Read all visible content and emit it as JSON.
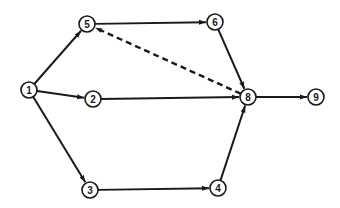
{
  "diagram": {
    "type": "activity-network",
    "nodes": [
      {
        "id": "1",
        "label": "1",
        "x": 29,
        "y": 90
      },
      {
        "id": "2",
        "label": "2",
        "x": 93,
        "y": 99
      },
      {
        "id": "3",
        "label": "3",
        "x": 90,
        "y": 190
      },
      {
        "id": "4",
        "label": "4",
        "x": 218,
        "y": 188
      },
      {
        "id": "5",
        "label": "5",
        "x": 87,
        "y": 24
      },
      {
        "id": "6",
        "label": "6",
        "x": 215,
        "y": 22
      },
      {
        "id": "8",
        "label": "8",
        "x": 248,
        "y": 97
      },
      {
        "id": "9",
        "label": "9",
        "x": 316,
        "y": 97
      }
    ],
    "edges": [
      {
        "from": "1",
        "to": "5",
        "style": "solid"
      },
      {
        "from": "1",
        "to": "2",
        "style": "solid"
      },
      {
        "from": "1",
        "to": "3",
        "style": "solid"
      },
      {
        "from": "5",
        "to": "6",
        "style": "solid"
      },
      {
        "from": "6",
        "to": "8",
        "style": "solid"
      },
      {
        "from": "2",
        "to": "8",
        "style": "solid"
      },
      {
        "from": "3",
        "to": "4",
        "style": "solid"
      },
      {
        "from": "4",
        "to": "8",
        "style": "solid"
      },
      {
        "from": "8",
        "to": "5",
        "style": "dashed"
      },
      {
        "from": "8",
        "to": "9",
        "style": "solid"
      }
    ]
  }
}
